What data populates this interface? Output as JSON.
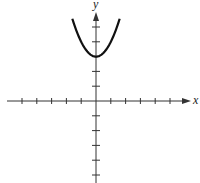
{
  "chart_data": {
    "type": "line",
    "title": "",
    "xlabel": "x",
    "ylabel": "y",
    "function": "y = x^2 + 3",
    "series": [
      {
        "name": "parabola",
        "x": [
          -1.6,
          -1.2,
          -0.8,
          -0.4,
          0,
          0.4,
          0.8,
          1.2,
          1.6
        ],
        "y": [
          5.56,
          4.44,
          3.64,
          3.16,
          3.0,
          3.16,
          3.64,
          4.44,
          5.56
        ]
      }
    ],
    "vertex": [
      0,
      3
    ],
    "xlim": [
      -6,
      6
    ],
    "ylim": [
      -6,
      6
    ],
    "x_ticks": [
      -5,
      -4,
      -3,
      -2,
      -1,
      1,
      2,
      3,
      4,
      5
    ],
    "y_ticks": [
      -5,
      -4,
      -3,
      -2,
      -1,
      1,
      2,
      3,
      4,
      5
    ],
    "tick_labels_shown": false,
    "grid": false,
    "legend": null
  },
  "labels": {
    "x_axis": "x",
    "y_axis": "y"
  },
  "colors": {
    "axis": "#333333",
    "curve": "#111111"
  }
}
